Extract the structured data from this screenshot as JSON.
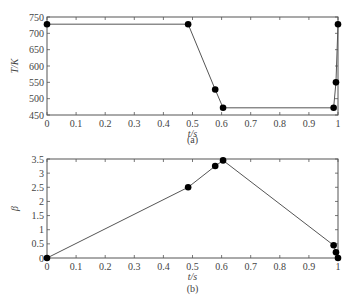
{
  "chart_data": [
    {
      "type": "line",
      "panel": "(a)",
      "title": "",
      "xlabel": "t/s",
      "ylabel": "T/K",
      "xlim": [
        0,
        1
      ],
      "ylim": [
        450,
        750
      ],
      "xticks": [
        "0",
        "0.1",
        "0.2",
        "0.3",
        "0.4",
        "0.5",
        "0.6",
        "0.7",
        "0.8",
        "0.9",
        "1"
      ],
      "yticks": [
        "450",
        "500",
        "550",
        "600",
        "650",
        "700",
        "750"
      ],
      "grid": false,
      "markers": true,
      "x": [
        0,
        0.485,
        0.578,
        0.605,
        0.985,
        0.993,
        1.0
      ],
      "values": [
        728,
        728,
        528,
        472,
        472,
        550,
        728
      ]
    },
    {
      "type": "line",
      "panel": "(b)",
      "title": "",
      "xlabel": "t/s",
      "ylabel": "β",
      "xlim": [
        0,
        1
      ],
      "ylim": [
        0,
        3.5
      ],
      "xticks": [
        "0",
        "0.1",
        "0.2",
        "0.3",
        "0.4",
        "0.5",
        "0.6",
        "0.7",
        "0.8",
        "0.9",
        "1"
      ],
      "yticks": [
        "0",
        "0.5",
        "1",
        "1.5",
        "2",
        "2.5",
        "3",
        "3.5"
      ],
      "grid": false,
      "markers": true,
      "x": [
        0,
        0.485,
        0.578,
        0.605,
        0.985,
        0.993,
        1.0
      ],
      "values": [
        0,
        2.5,
        3.25,
        3.45,
        0.45,
        0.2,
        0
      ]
    }
  ]
}
